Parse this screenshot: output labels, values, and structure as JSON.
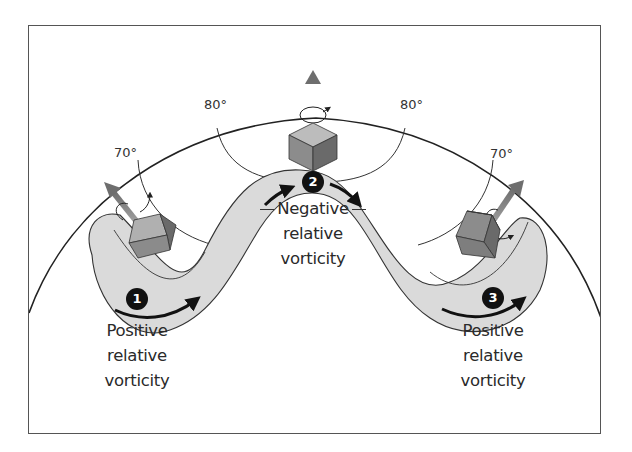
{
  "figure": {
    "latitude_labels": {
      "left_70": "70°",
      "left_80": "80°",
      "right_80": "80°",
      "right_70": "70°"
    },
    "stations": [
      {
        "number": "1",
        "line1": "Positive",
        "line2": "relative",
        "line3": "vorticity"
      },
      {
        "number": "2",
        "line1": "Negative",
        "line2": "relative",
        "line3": "vorticity"
      },
      {
        "number": "3",
        "line1": "Positive",
        "line2": "relative",
        "line3": "vorticity"
      }
    ],
    "colors": {
      "flow_band": "#dcdcdc",
      "cube_top": "#b5b5b5",
      "cube_left": "#8e8e8e",
      "cube_right": "#6c6c6c",
      "axis_arrow": "#7a7a7a",
      "outline": "#222222",
      "badge": "#111111"
    }
  }
}
